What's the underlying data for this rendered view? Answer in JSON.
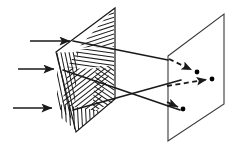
{
  "figure": {
    "canvas": {
      "width": 236,
      "height": 147
    },
    "colors": {
      "background": "#ffffff",
      "stroke": "#1a1a1a",
      "hatch": "#1a1a1a",
      "point": "#000000"
    },
    "stroke_widths": {
      "plane_edge": 1.1,
      "ray": 1.6,
      "hatch": 1.0,
      "dashed_ray": 1.8
    }
  },
  "hatched_plane": {
    "name": "hatched-grating-plane",
    "outline": "56,52 115,8 115,99 76,132",
    "label": "grating plane",
    "hatch_regions": [
      {
        "name": "upper-triangle-right",
        "clip": "115,8 115,47 80,47 80,50",
        "angle": 72,
        "spacing": 4
      },
      {
        "name": "top-band",
        "clip": "78,49 115,49 115,68 68,68",
        "angle": 8,
        "spacing": 4
      },
      {
        "name": "left-vertical-band",
        "clip": "56,52 78,52 74,120 56,108",
        "angle": 78,
        "spacing": 4
      },
      {
        "name": "center-diagonal-a",
        "clip": "68,68 112,68 96,112 62,106",
        "angle": 50,
        "spacing": 4
      },
      {
        "name": "center-diagonal-b",
        "clip": "95,66 115,66 115,103 92,112",
        "angle": 125,
        "spacing": 4
      },
      {
        "name": "lower-vertical-band",
        "clip": "58,104 100,111 78,132 60,118",
        "angle": 90,
        "spacing": 4
      }
    ]
  },
  "screen_plane": {
    "name": "screen-plane",
    "outline": "168,56 224,14 224,104 168,141",
    "label": "screen"
  },
  "incoming_rays": [
    {
      "name": "incoming-ray-top",
      "x1": 30,
      "y1": 41,
      "x2": 74,
      "y2": 41
    },
    {
      "name": "incoming-ray-middle",
      "x1": 18,
      "y1": 69,
      "x2": 58,
      "y2": 69
    },
    {
      "name": "incoming-ray-bottom",
      "x1": 13,
      "y1": 108,
      "x2": 56,
      "y2": 108
    }
  ],
  "diffracted_rays": [
    {
      "name": "diffracted-ray-upper",
      "x1": 73,
      "y1": 41,
      "x2": 168,
      "y2": 60
    },
    {
      "name": "diffracted-ray-cross-down",
      "x1": 63,
      "y1": 70,
      "x2": 180,
      "y2": 110
    },
    {
      "name": "diffracted-ray-cross-up",
      "x1": 73,
      "y1": 110,
      "x2": 181,
      "y2": 80
    }
  ],
  "image_points": [
    {
      "name": "image-point-upper",
      "x1": 169,
      "y1": 59,
      "x2": 196,
      "y2": 72,
      "dot_x": 197,
      "dot_y": 72
    },
    {
      "name": "image-point-middle",
      "x1": 167,
      "y1": 86,
      "x2": 211,
      "y2": 79,
      "dot_x": 212,
      "dot_y": 79
    },
    {
      "name": "image-point-lower",
      "x1": 167,
      "y1": 102,
      "x2": 182,
      "y2": 109,
      "dot_x": 183,
      "dot_y": 109
    }
  ]
}
